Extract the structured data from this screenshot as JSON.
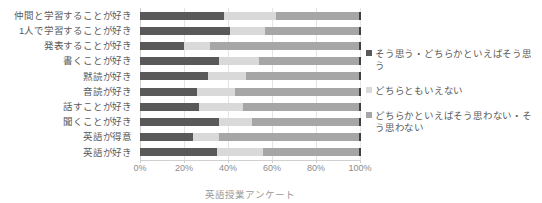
{
  "chart_data": {
    "type": "bar",
    "orientation": "horizontal",
    "stacked": true,
    "normalized_percent": true,
    "title": "",
    "xlabel": "英語授業アンケート",
    "ylabel": "",
    "xlim": [
      0,
      100
    ],
    "grid": true,
    "legend_position": "right",
    "tick_labels": [
      "0%",
      "20%",
      "40%",
      "60%",
      "80%",
      "100%"
    ],
    "tick_values": [
      0,
      20,
      40,
      60,
      80,
      100
    ],
    "categories": [
      "仲間と学習することが好き",
      "1人で学習することが好き",
      "発表することが好き",
      "書くことが好き",
      "黙読が好き",
      "音読が好き",
      "話すことが好き",
      "聞くことが好き",
      "英語が得意",
      "英語が好き"
    ],
    "series": [
      {
        "name": "そう思う・どちらかといえばそう思う",
        "color": "#595959",
        "values": [
          38,
          41,
          20,
          36,
          31,
          26,
          27,
          36,
          24,
          35
        ]
      },
      {
        "name": "どちらともいえない",
        "color": "#d9d9d9",
        "values": [
          24,
          16,
          12,
          18,
          17,
          17,
          20,
          15,
          12,
          21
        ]
      },
      {
        "name": "どちらかといえばそう思わない・そう思わない",
        "color": "#a6a6a6",
        "values": [
          38,
          43,
          68,
          46,
          52,
          57,
          53,
          49,
          64,
          44
        ]
      }
    ]
  },
  "legend": {
    "items": [
      {
        "label": "そう思う・どちらかといえばそう思う",
        "color": "#595959"
      },
      {
        "label": "どちらともいえない",
        "color": "#d9d9d9"
      },
      {
        "label": "どちらかといえばそう思わない・そう思わない",
        "color": "#a6a6a6"
      }
    ]
  }
}
